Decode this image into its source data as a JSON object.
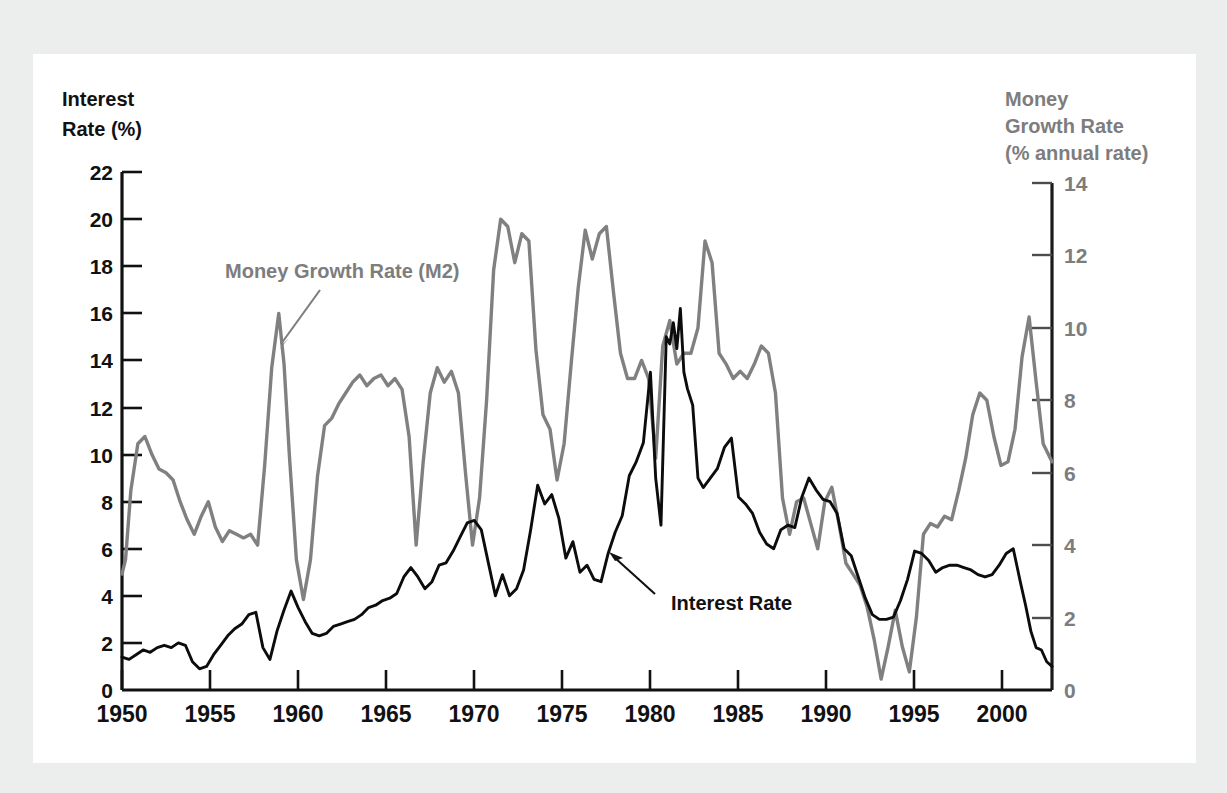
{
  "figure": {
    "background_color": "#eceded",
    "panel_color": "#ffffff",
    "interest_color": "#0c0c0c",
    "money_color": "#808080"
  },
  "axis_titles": {
    "left_line1": "Interest",
    "left_line2": "Rate (%)",
    "right_line1": "Money",
    "right_line2": "Growth Rate",
    "right_line3": "(% annual rate)"
  },
  "annotations": {
    "money": "Money Growth Rate (M2)",
    "interest": "Interest Rate"
  },
  "chart_data": {
    "type": "line",
    "title": "",
    "xlabel": "",
    "ylabel": "Interest Rate (%)",
    "y2label": "Money Growth Rate (% annual rate)",
    "grid": false,
    "legend": "annotated-inline",
    "xlim": [
      1950,
      2002.8
    ],
    "ylim": [
      0,
      22
    ],
    "y2lim": [
      0,
      14
    ],
    "xticks": [
      1950,
      1955,
      1960,
      1965,
      1970,
      1975,
      1980,
      1985,
      1990,
      1995,
      2000
    ],
    "yticks_left": [
      0,
      2,
      4,
      6,
      8,
      10,
      12,
      14,
      16,
      18,
      20,
      22
    ],
    "yticks_right": [
      0,
      2,
      4,
      6,
      8,
      10,
      12,
      14
    ],
    "series": [
      {
        "name": "Interest Rate",
        "axis": "left",
        "color": "#0c0c0c",
        "units": "%",
        "x": [
          1950.0,
          1950.4,
          1950.8,
          1951.2,
          1951.6,
          1952.0,
          1952.4,
          1952.8,
          1953.2,
          1953.6,
          1954.0,
          1954.4,
          1954.8,
          1955.2,
          1955.6,
          1956.0,
          1956.4,
          1956.8,
          1957.2,
          1957.6,
          1958.0,
          1958.4,
          1958.8,
          1959.2,
          1959.6,
          1960.0,
          1960.4,
          1960.8,
          1961.2,
          1961.6,
          1962.0,
          1962.4,
          1962.8,
          1963.2,
          1963.6,
          1964.0,
          1964.4,
          1964.8,
          1965.2,
          1965.6,
          1966.0,
          1966.4,
          1966.8,
          1967.2,
          1967.6,
          1968.0,
          1968.4,
          1968.8,
          1969.2,
          1969.6,
          1970.0,
          1970.4,
          1970.8,
          1971.2,
          1971.6,
          1972.0,
          1972.4,
          1972.8,
          1973.2,
          1973.6,
          1974.0,
          1974.4,
          1974.8,
          1975.2,
          1975.6,
          1976.0,
          1976.4,
          1976.8,
          1977.2,
          1977.6,
          1978.0,
          1978.4,
          1978.8,
          1979.2,
          1979.6,
          1980.0,
          1980.3,
          1980.6,
          1980.9,
          1981.1,
          1981.3,
          1981.5,
          1981.7,
          1981.9,
          1982.1,
          1982.4,
          1982.7,
          1983.0,
          1983.4,
          1983.8,
          1984.2,
          1984.6,
          1985.0,
          1985.4,
          1985.8,
          1986.2,
          1986.6,
          1987.0,
          1987.4,
          1987.8,
          1988.2,
          1988.6,
          1989.0,
          1989.4,
          1989.8,
          1990.2,
          1990.6,
          1991.0,
          1991.4,
          1991.8,
          1992.2,
          1992.6,
          1993.0,
          1993.4,
          1993.8,
          1994.2,
          1994.6,
          1995.0,
          1995.4,
          1995.8,
          1996.2,
          1996.6,
          1997.0,
          1997.4,
          1997.8,
          1998.2,
          1998.6,
          1999.0,
          1999.4,
          1999.8,
          2000.2,
          2000.6,
          2001.0,
          2001.3,
          2001.6,
          2001.9,
          2002.2,
          2002.5,
          2002.8
        ],
        "y": [
          1.4,
          1.3,
          1.5,
          1.7,
          1.6,
          1.8,
          1.9,
          1.8,
          2.0,
          1.9,
          1.2,
          0.9,
          1.0,
          1.5,
          1.9,
          2.3,
          2.6,
          2.8,
          3.2,
          3.3,
          1.8,
          1.3,
          2.5,
          3.4,
          4.2,
          3.5,
          2.9,
          2.4,
          2.3,
          2.4,
          2.7,
          2.8,
          2.9,
          3.0,
          3.2,
          3.5,
          3.6,
          3.8,
          3.9,
          4.1,
          4.8,
          5.2,
          4.8,
          4.3,
          4.6,
          5.3,
          5.4,
          5.9,
          6.5,
          7.1,
          7.2,
          6.8,
          5.4,
          4.0,
          4.9,
          4.0,
          4.3,
          5.1,
          6.8,
          8.7,
          7.9,
          8.3,
          7.3,
          5.6,
          6.3,
          5.0,
          5.3,
          4.7,
          4.6,
          5.8,
          6.7,
          7.4,
          9.1,
          9.7,
          10.5,
          13.5,
          9.0,
          7.0,
          15.0,
          14.7,
          15.6,
          14.5,
          16.2,
          13.5,
          12.8,
          12.1,
          9.0,
          8.6,
          9.0,
          9.4,
          10.3,
          10.7,
          8.2,
          7.9,
          7.5,
          6.7,
          6.2,
          6.0,
          6.8,
          7.0,
          6.9,
          8.2,
          9.0,
          8.5,
          8.1,
          8.0,
          7.5,
          6.0,
          5.7,
          4.8,
          3.9,
          3.2,
          3.0,
          3.0,
          3.1,
          3.8,
          4.7,
          5.9,
          5.8,
          5.5,
          5.0,
          5.2,
          5.3,
          5.3,
          5.2,
          5.1,
          4.9,
          4.8,
          4.9,
          5.3,
          5.8,
          6.0,
          4.6,
          3.6,
          2.5,
          1.8,
          1.7,
          1.2,
          1.0
        ],
        "peak_value": 16.2,
        "peak_year": 1981.7,
        "min_value": 0.9,
        "min_year": 1954.4
      },
      {
        "name": "Money Growth Rate (M2)",
        "axis": "right",
        "color": "#808080",
        "units": "% annual rate",
        "x": [
          1950.0,
          1950.2,
          1950.5,
          1950.9,
          1951.3,
          1951.7,
          1952.1,
          1952.5,
          1952.9,
          1953.3,
          1953.7,
          1954.1,
          1954.5,
          1954.9,
          1955.3,
          1955.7,
          1956.1,
          1956.5,
          1956.9,
          1957.3,
          1957.7,
          1958.1,
          1958.5,
          1958.9,
          1959.2,
          1959.5,
          1959.9,
          1960.3,
          1960.7,
          1961.1,
          1961.5,
          1961.9,
          1962.3,
          1962.7,
          1963.1,
          1963.5,
          1963.9,
          1964.3,
          1964.7,
          1965.1,
          1965.5,
          1965.9,
          1966.3,
          1966.7,
          1967.1,
          1967.5,
          1967.9,
          1968.3,
          1968.7,
          1969.1,
          1969.5,
          1969.9,
          1970.3,
          1970.7,
          1971.1,
          1971.5,
          1971.9,
          1972.3,
          1972.7,
          1973.1,
          1973.5,
          1973.9,
          1974.3,
          1974.7,
          1975.1,
          1975.5,
          1975.9,
          1976.3,
          1976.7,
          1977.1,
          1977.5,
          1977.9,
          1978.3,
          1978.7,
          1979.1,
          1979.5,
          1979.9,
          1980.3,
          1980.7,
          1981.1,
          1981.5,
          1981.9,
          1982.3,
          1982.7,
          1983.1,
          1983.5,
          1983.9,
          1984.3,
          1984.7,
          1985.1,
          1985.5,
          1985.9,
          1986.3,
          1986.7,
          1987.1,
          1987.5,
          1987.9,
          1988.3,
          1988.7,
          1989.1,
          1989.5,
          1989.9,
          1990.3,
          1990.7,
          1991.1,
          1991.5,
          1991.9,
          1992.3,
          1992.7,
          1993.1,
          1993.5,
          1993.9,
          1994.3,
          1994.7,
          1995.1,
          1995.5,
          1995.9,
          1996.3,
          1996.7,
          1997.1,
          1997.5,
          1997.9,
          1998.3,
          1998.7,
          1999.1,
          1999.5,
          1999.9,
          2000.3,
          2000.7,
          2001.1,
          2001.5,
          2001.9,
          2002.3,
          2002.8
        ],
        "y": [
          3.2,
          3.6,
          5.5,
          6.8,
          7.0,
          6.5,
          6.1,
          6.0,
          5.8,
          5.2,
          4.7,
          4.3,
          4.8,
          5.2,
          4.5,
          4.1,
          4.4,
          4.3,
          4.2,
          4.3,
          4.0,
          6.2,
          8.9,
          10.4,
          9.0,
          6.5,
          3.6,
          2.5,
          3.6,
          5.9,
          7.3,
          7.5,
          7.9,
          8.2,
          8.5,
          8.7,
          8.4,
          8.6,
          8.7,
          8.4,
          8.6,
          8.3,
          7.0,
          4.0,
          6.3,
          8.2,
          8.9,
          8.5,
          8.8,
          8.2,
          6.0,
          4.0,
          5.3,
          8.0,
          11.6,
          13.0,
          12.8,
          11.8,
          12.6,
          12.4,
          9.4,
          7.6,
          7.2,
          5.8,
          6.8,
          9.0,
          11.1,
          12.7,
          11.9,
          12.6,
          12.8,
          11.0,
          9.3,
          8.6,
          8.6,
          9.1,
          8.6,
          6.4,
          9.5,
          10.2,
          9.0,
          9.3,
          9.3,
          10.0,
          12.4,
          11.8,
          9.3,
          9.0,
          8.6,
          8.8,
          8.6,
          9.0,
          9.5,
          9.3,
          8.2,
          5.3,
          4.3,
          5.2,
          5.3,
          4.6,
          3.9,
          5.2,
          5.6,
          4.6,
          3.5,
          3.2,
          2.9,
          2.3,
          1.4,
          0.3,
          1.2,
          2.2,
          1.2,
          0.5,
          2.0,
          4.3,
          4.6,
          4.5,
          4.8,
          4.7,
          5.5,
          6.4,
          7.6,
          8.2,
          8.0,
          7.0,
          6.2,
          6.3,
          7.2,
          9.2,
          10.3,
          8.5,
          6.8,
          6.3
        ],
        "peak_value": 13.0,
        "peak_year": 1971.5,
        "min_value": 0.3,
        "min_year": 1993.1
      }
    ]
  }
}
